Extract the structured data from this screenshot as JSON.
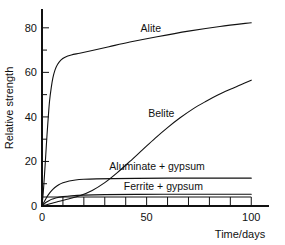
{
  "chart_data": {
    "type": "line",
    "title": "",
    "subtitle": "",
    "xlabel": "Time/days",
    "ylabel": "Relative strength",
    "xlim": [
      0,
      108
    ],
    "ylim": [
      0,
      88
    ],
    "grid": false,
    "legend_position": "inline-labels",
    "x_ticks_major": [
      0,
      50,
      100
    ],
    "x_tick_labels": [
      "0",
      "50",
      "100"
    ],
    "x_ticks_minor": [
      10,
      20,
      30,
      40,
      60,
      70,
      80,
      90
    ],
    "y_ticks_major": [
      0,
      20,
      40,
      60,
      80
    ],
    "y_tick_labels": [
      "0",
      "20",
      "40",
      "60",
      "80"
    ],
    "y_ticks_minor": [
      10,
      30,
      50,
      70
    ],
    "series": [
      {
        "name": "Alite",
        "label": "Alite",
        "label_x": 52,
        "label_y": 78,
        "color": "#111111",
        "points": [
          [
            0,
            0
          ],
          [
            0.6,
            6
          ],
          [
            1.2,
            14
          ],
          [
            1.8,
            23
          ],
          [
            2.4,
            32
          ],
          [
            3.0,
            40
          ],
          [
            3.6,
            47
          ],
          [
            4.4,
            53
          ],
          [
            5.2,
            57.5
          ],
          [
            6.2,
            61
          ],
          [
            7.4,
            63.5
          ],
          [
            9,
            65.5
          ],
          [
            11,
            66.8
          ],
          [
            14,
            67.8
          ],
          [
            18,
            68.6
          ],
          [
            24,
            69.8
          ],
          [
            32,
            71.5
          ],
          [
            42,
            73.6
          ],
          [
            55,
            76.0
          ],
          [
            70,
            78.5
          ],
          [
            85,
            80.6
          ],
          [
            100,
            82.3
          ]
        ]
      },
      {
        "name": "Belite",
        "label": "Belite",
        "label_x": 57,
        "label_y": 40,
        "color": "#111111",
        "points": [
          [
            0,
            0
          ],
          [
            3,
            0.8
          ],
          [
            7,
            1.8
          ],
          [
            12,
            3.0
          ],
          [
            18,
            4.6
          ],
          [
            24,
            7.0
          ],
          [
            30,
            10.5
          ],
          [
            36,
            15.0
          ],
          [
            42,
            20.0
          ],
          [
            48,
            25.2
          ],
          [
            54,
            30.4
          ],
          [
            60,
            35.2
          ],
          [
            66,
            39.6
          ],
          [
            72,
            43.5
          ],
          [
            78,
            46.8
          ],
          [
            84,
            49.8
          ],
          [
            90,
            52.4
          ],
          [
            95,
            54.4
          ],
          [
            100,
            56.5
          ]
        ]
      },
      {
        "name": "Aluminate + gypsum",
        "label": "Aluminate + gypsum",
        "label_x": 55,
        "label_y": 16,
        "color": "#111111",
        "points": [
          [
            0,
            0
          ],
          [
            1,
            1.8
          ],
          [
            2,
            3.5
          ],
          [
            3,
            5.0
          ],
          [
            4.5,
            6.8
          ],
          [
            6,
            8.2
          ],
          [
            8,
            9.5
          ],
          [
            10,
            10.4
          ],
          [
            13,
            11.2
          ],
          [
            16,
            11.7
          ],
          [
            20,
            12.0
          ],
          [
            26,
            12.2
          ],
          [
            34,
            12.3
          ],
          [
            45,
            12.4
          ],
          [
            60,
            12.5
          ],
          [
            80,
            12.5
          ],
          [
            100,
            12.5
          ]
        ]
      },
      {
        "name": "Ferrite + gypsum",
        "label": "Ferrite + gypsum",
        "label_x": 58,
        "label_y": 7.2,
        "color": "#111111",
        "points": [
          [
            0,
            0
          ],
          [
            1,
            0.9
          ],
          [
            2,
            1.7
          ],
          [
            3.5,
            2.5
          ],
          [
            5,
            3.1
          ],
          [
            7,
            3.7
          ],
          [
            10,
            4.2
          ],
          [
            14,
            4.6
          ],
          [
            20,
            4.9
          ],
          [
            30,
            5.1
          ],
          [
            45,
            5.2
          ],
          [
            65,
            5.3
          ],
          [
            85,
            5.3
          ],
          [
            100,
            5.3
          ]
        ]
      }
    ]
  }
}
